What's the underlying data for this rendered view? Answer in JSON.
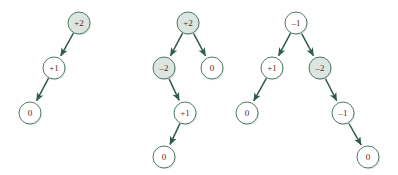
{
  "figure": {
    "background_color": "#ffffff",
    "node_fill_shaded": "#dde5e1",
    "node_fill_open": "#ffffff",
    "node_stroke_color": "#3d6b59",
    "edge_color": "#2e5b4b",
    "label_color": "#5a2a28",
    "node_radius": 11
  },
  "chart_data": {
    "type": "diagram",
    "xlabel": "",
    "ylabel": "",
    "trees": [
      {
        "name": "tree-1",
        "nodes": [
          {
            "id": "t1n1",
            "label": "+2",
            "x": 79,
            "y": 23,
            "shaded": true
          },
          {
            "id": "t1n2",
            "label": "+1",
            "x": 54,
            "y": 68,
            "shaded": false
          },
          {
            "id": "t1n3",
            "label": "0",
            "x": 30,
            "y": 113,
            "shaded": false
          }
        ],
        "edges": [
          {
            "from": "t1n1",
            "to": "t1n2",
            "arrow": true
          },
          {
            "from": "t1n2",
            "to": "t1n3",
            "arrow": true
          }
        ]
      },
      {
        "name": "tree-2",
        "nodes": [
          {
            "id": "t2n1",
            "label": "+2",
            "x": 188,
            "y": 23,
            "shaded": true
          },
          {
            "id": "t2n2",
            "label": "-2",
            "x": 164,
            "y": 68,
            "shaded": true
          },
          {
            "id": "t2n3",
            "label": "0",
            "x": 212,
            "y": 68,
            "shaded": false
          },
          {
            "id": "t2n4",
            "label": "+1",
            "x": 185,
            "y": 113,
            "shaded": false
          },
          {
            "id": "t2n5",
            "label": "0",
            "x": 164,
            "y": 157,
            "shaded": false
          }
        ],
        "edges": [
          {
            "from": "t2n1",
            "to": "t2n2",
            "arrow": true
          },
          {
            "from": "t2n1",
            "to": "t2n3",
            "arrow": true
          },
          {
            "from": "t2n2",
            "to": "t2n4",
            "arrow": true
          },
          {
            "from": "t2n4",
            "to": "t2n5",
            "arrow": true
          }
        ]
      },
      {
        "name": "tree-3",
        "nodes": [
          {
            "id": "t3n1",
            "label": "-1",
            "x": 296,
            "y": 23,
            "shaded": false
          },
          {
            "id": "t3n2",
            "label": "+1",
            "x": 272,
            "y": 68,
            "shaded": false
          },
          {
            "id": "t3n3",
            "label": "-2",
            "x": 320,
            "y": 68,
            "shaded": true
          },
          {
            "id": "t3n4",
            "label": "0",
            "x": 247,
            "y": 113,
            "shaded": false
          },
          {
            "id": "t3n5",
            "label": "-1",
            "x": 343,
            "y": 113,
            "shaded": false
          },
          {
            "id": "t3n6",
            "label": "0",
            "x": 368,
            "y": 157,
            "shaded": false
          }
        ],
        "edges": [
          {
            "from": "t3n1",
            "to": "t3n2",
            "arrow": true
          },
          {
            "from": "t3n1",
            "to": "t3n3",
            "arrow": true
          },
          {
            "from": "t3n2",
            "to": "t3n4",
            "arrow": true
          },
          {
            "from": "t3n3",
            "to": "t3n5",
            "arrow": true
          },
          {
            "from": "t3n5",
            "to": "t3n6",
            "arrow": true
          }
        ]
      }
    ]
  }
}
